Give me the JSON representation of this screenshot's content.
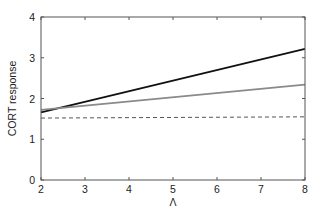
{
  "chart_data": {
    "type": "line",
    "title": "",
    "xlabel": "Λ",
    "ylabel": "CORT response",
    "xlim": [
      2,
      8
    ],
    "ylim": [
      0,
      4
    ],
    "xticks": [
      2,
      3,
      4,
      5,
      6,
      7,
      8
    ],
    "yticks": [
      0,
      1,
      2,
      3,
      4
    ],
    "grid": false,
    "legend": null,
    "series": [
      {
        "name": "black solid line",
        "style": "solid",
        "color": "#111111",
        "width": 1.8,
        "x": [
          2,
          8
        ],
        "y": [
          1.66,
          3.22
        ]
      },
      {
        "name": "gray solid line",
        "style": "solid",
        "color": "#8a8a8a",
        "width": 1.8,
        "x": [
          2,
          8
        ],
        "y": [
          1.72,
          2.34
        ]
      },
      {
        "name": "dashed line",
        "style": "dashed",
        "color": "#555555",
        "width": 1.0,
        "x": [
          2,
          8
        ],
        "y": [
          1.52,
          1.55
        ]
      }
    ]
  }
}
